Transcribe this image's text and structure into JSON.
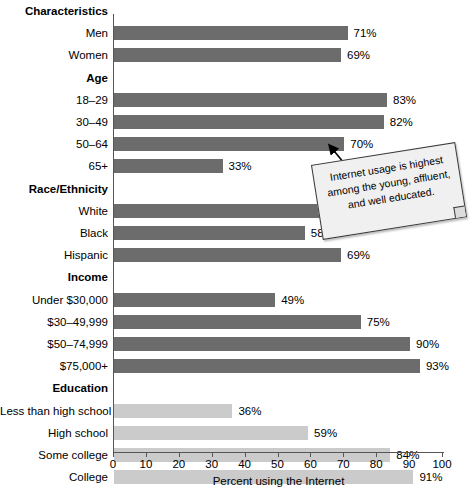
{
  "chart_data": {
    "type": "bar",
    "orientation": "horizontal",
    "title": "",
    "xlabel": "Percent using the Internet",
    "ylabel": "",
    "xlim": [
      0,
      100
    ],
    "xticks": [
      0,
      10,
      20,
      30,
      40,
      50,
      60,
      70,
      80,
      90,
      100
    ],
    "grid": false,
    "legend": "none",
    "value_suffix": "%",
    "group_header_label": "Characteristics",
    "groups": [
      {
        "name": "Characteristics",
        "is_header_row": true,
        "color": "#6c6c6c",
        "categories": [
          "Men",
          "Women"
        ],
        "values": [
          71,
          69
        ],
        "labels": [
          "71%",
          "69%"
        ]
      },
      {
        "name": "Age",
        "is_header_row": true,
        "color": "#6c6c6c",
        "categories": [
          "18–29",
          "30–49",
          "50–64",
          "65+"
        ],
        "values": [
          83,
          82,
          70,
          33
        ],
        "labels": [
          "83%",
          "82%",
          "70%",
          "33%"
        ]
      },
      {
        "name": "Race/Ethnicity",
        "is_header_row": true,
        "color": "#6c6c6c",
        "categories": [
          "White",
          "Black",
          "Hispanic"
        ],
        "values": [
          72,
          58,
          69
        ],
        "labels": [
          "72%",
          "58%",
          "69%"
        ]
      },
      {
        "name": "Income",
        "is_header_row": true,
        "color": "#6c6c6c",
        "categories": [
          "Under $30,000",
          "$30–49,999",
          "$50–74,999",
          "$75,000+"
        ],
        "values": [
          49,
          75,
          90,
          93
        ],
        "labels": [
          "49%",
          "75%",
          "90%",
          "93%"
        ]
      },
      {
        "name": "Education",
        "is_header_row": true,
        "color": "#cbcbcb",
        "categories": [
          "Less than high school",
          "High school",
          "Some college",
          "College"
        ],
        "values": [
          36,
          59,
          84,
          91
        ],
        "labels": [
          "36%",
          "59%",
          "84%",
          "91%"
        ]
      }
    ],
    "annotation": {
      "text": "Internet usage is highest among the young, affluent, and well educated.",
      "points_to_category": "30–49",
      "style": "sticky-note"
    },
    "colors": {
      "bar_dark": "#6c6c6c",
      "bar_light": "#cbcbcb",
      "axis": "#555555",
      "text": "#000000",
      "callout_fill": "#f0f0f0",
      "callout_border": "#3a3a3a"
    }
  }
}
